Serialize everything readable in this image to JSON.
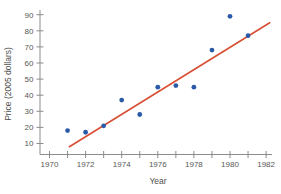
{
  "chart_data": {
    "type": "scatter",
    "title": "",
    "xlabel": "Year",
    "ylabel": "Price (2005 dollars)",
    "x": [
      1971,
      1972,
      1973,
      1974,
      1975,
      1976,
      1977,
      1978,
      1979,
      1980,
      1981
    ],
    "y": [
      18,
      17,
      21,
      37,
      28,
      45,
      46,
      45,
      68,
      89,
      77
    ],
    "x_tick_years": [
      1970,
      1971,
      1972,
      1973,
      1974,
      1975,
      1976,
      1977,
      1978,
      1979,
      1980,
      1981,
      1982
    ],
    "x_tick_labels": [
      "1970",
      "",
      "1972",
      "",
      "1974",
      "",
      "1976",
      "",
      "1978",
      "",
      "1980",
      "",
      "1982"
    ],
    "y_tick_values": [
      10,
      20,
      30,
      40,
      50,
      60,
      70,
      80,
      90
    ],
    "xlim": [
      1970,
      1982.3
    ],
    "ylim": [
      3,
      96
    ],
    "grid": false,
    "legend": null,
    "trendline": {
      "x1": 1971.1,
      "y1": 8,
      "x2": 1982.2,
      "y2": 85
    },
    "colors": {
      "point": "#2a5aa8",
      "trend": "#d94f33",
      "axis": "#8c8c8c",
      "tick_text": "#575757"
    }
  }
}
